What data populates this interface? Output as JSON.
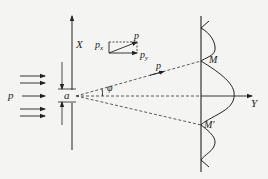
{
  "diagram": {
    "labels": {
      "incident_momentum": "p",
      "slit_width": "a",
      "x_axis": "X",
      "y_axis": "Y",
      "angle": "φ",
      "diffracted_momentum": "p",
      "vector_p": "p",
      "vector_px_base": "p",
      "vector_px_sub": "x",
      "vector_py_base": "p",
      "vector_py_sub": "y",
      "first_min_upper": "M",
      "first_min_lower": "M'"
    },
    "colors": {
      "ink": "#222222",
      "background": "#f4f4f2"
    },
    "elements": {
      "incident_beam_arrows": 5,
      "screen": "vertical line with intensity distribution curve",
      "intensity_pattern": "central maximum on Y axis, first minima at M and M', secondary maxima beyond"
    }
  }
}
